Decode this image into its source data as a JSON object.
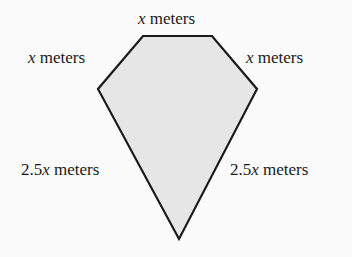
{
  "figure": {
    "shape": "pentagon",
    "fill_color": "#e6e6e6",
    "stroke_color": "#1a1a1a",
    "vertices": [
      [
        143,
        36
      ],
      [
        212,
        36
      ],
      [
        257,
        89
      ],
      [
        179,
        239
      ],
      [
        98,
        89
      ]
    ],
    "labels": {
      "top": {
        "var": "x",
        "unit": " meters"
      },
      "upper_left": {
        "var": "x",
        "unit": " meters"
      },
      "upper_right": {
        "var": "x",
        "unit": " meters"
      },
      "lower_left": {
        "coef": "2.5",
        "var": "x",
        "unit": " meters"
      },
      "lower_right": {
        "coef": "2.5",
        "var": "x",
        "unit": " meters"
      }
    }
  }
}
